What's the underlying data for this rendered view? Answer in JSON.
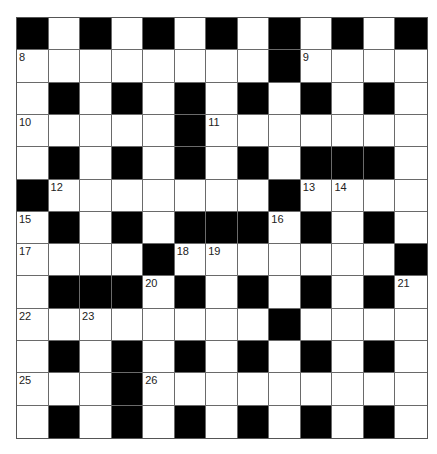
{
  "puzzle": {
    "type": "crossword",
    "rows": 13,
    "cols": 13,
    "colors": {
      "block": "#000000",
      "cell": "#ffffff",
      "grid_line": "#6a6a6a"
    },
    "grid": [
      "#.#.#.#.#.#.#",
      "........#....",
      ".#.#.#.#.#.#.",
      ".....#.......",
      ".#.#.#.#.###.",
      "#.......#....",
      ".#.#.###.#.#.",
      "....#.......#",
      ".###.#.#.#.#.",
      "........#....",
      ".#.#.#.#.#.#.",
      "...#.........",
      ".#.#.#.#.#.#."
    ],
    "grid_legend": {
      ".": "open-square",
      "#": "black-square"
    },
    "numbers": [
      {
        "n": "1",
        "row": 0,
        "col": 0
      },
      {
        "n": "2",
        "row": 0,
        "col": 2
      },
      {
        "n": "3",
        "row": 0,
        "col": 4
      },
      {
        "n": "4",
        "row": 0,
        "col": 6
      },
      {
        "n": "5",
        "row": 0,
        "col": 8
      },
      {
        "n": "6",
        "row": 0,
        "col": 10
      },
      {
        "n": "7",
        "row": 0,
        "col": 12
      },
      {
        "n": "8",
        "row": 1,
        "col": 0
      },
      {
        "n": "9",
        "row": 1,
        "col": 9
      },
      {
        "n": "10",
        "row": 3,
        "col": 0
      },
      {
        "n": "11",
        "row": 3,
        "col": 6
      },
      {
        "n": "12",
        "row": 5,
        "col": 1
      },
      {
        "n": "13",
        "row": 5,
        "col": 9
      },
      {
        "n": "14",
        "row": 5,
        "col": 10
      },
      {
        "n": "15",
        "row": 6,
        "col": 0
      },
      {
        "n": "16",
        "row": 6,
        "col": 8
      },
      {
        "n": "17",
        "row": 7,
        "col": 0
      },
      {
        "n": "18",
        "row": 7,
        "col": 5
      },
      {
        "n": "19",
        "row": 7,
        "col": 6
      },
      {
        "n": "20",
        "row": 8,
        "col": 4
      },
      {
        "n": "21",
        "row": 8,
        "col": 12
      },
      {
        "n": "22",
        "row": 9,
        "col": 0
      },
      {
        "n": "23",
        "row": 9,
        "col": 2
      },
      {
        "n": "24",
        "row": 9,
        "col": 8
      },
      {
        "n": "25",
        "row": 11,
        "col": 0
      },
      {
        "n": "26",
        "row": 11,
        "col": 4
      }
    ]
  }
}
